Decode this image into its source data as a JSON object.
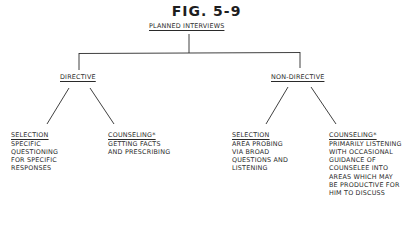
{
  "figure": {
    "title": "FIG. 5-9",
    "root": "PLANNED INTERVIEWS",
    "branches": [
      {
        "label": "DIRECTIVE",
        "children": [
          {
            "label": "SELECTION",
            "lines": [
              "SPECIFIC",
              "QUESTIONING",
              "FOR SPECIFIC",
              "RESPONSES"
            ]
          },
          {
            "label": "COUNSELING*",
            "lines": [
              "GETTING FACTS",
              "AND PRESCRIBING"
            ]
          }
        ]
      },
      {
        "label": "NON-DIRECTIVE",
        "children": [
          {
            "label": "SELECTION",
            "lines": [
              "AREA PROBING",
              "VIA BROAD",
              "QUESTIONS AND",
              "LISTENING"
            ]
          },
          {
            "label": "COUNSELING*",
            "lines": [
              "PRIMARILY LISTENING",
              "WITH OCCASIONAL",
              "GUIDANCE OF",
              "COUNSELEE INTO",
              "AREAS WHICH MAY",
              "BE PRODUCTIVE FOR",
              "HIM TO DISCUSS"
            ]
          }
        ]
      }
    ]
  }
}
